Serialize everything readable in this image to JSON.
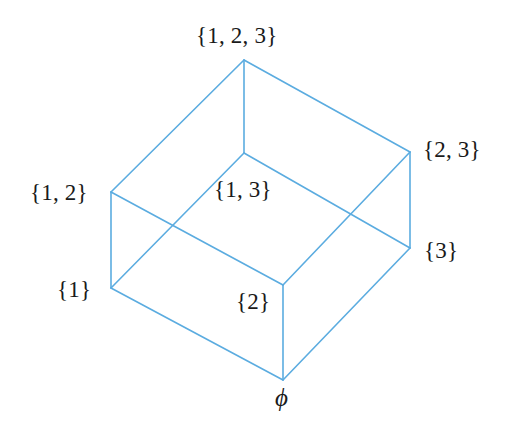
{
  "figure": {
    "width": 511,
    "height": 436,
    "background": "#ffffff",
    "edge_color": "#5BACE0",
    "edge_width": 1.6,
    "label_color": "#1a1a1a"
  },
  "chart_data": {
    "type": "diagram",
    "title": "",
    "nodes": [
      {
        "id": "full",
        "label": "{1, 2, 3}",
        "x": 244,
        "y": 60,
        "label_x": 196,
        "label_y": 24,
        "label_anchor": "above"
      },
      {
        "id": "s12",
        "label": "{1, 2}",
        "x": 111,
        "y": 192,
        "label_x": 30,
        "label_y": 181,
        "label_anchor": "left"
      },
      {
        "id": "s13",
        "label": "{1, 3}",
        "x": 244,
        "y": 153,
        "label_x": 214,
        "label_y": 178,
        "label_anchor": "below"
      },
      {
        "id": "s23",
        "label": "{2, 3}",
        "x": 410,
        "y": 152,
        "label_x": 423,
        "label_y": 138,
        "label_anchor": "right"
      },
      {
        "id": "s1",
        "label": "{1}",
        "x": 111,
        "y": 288,
        "label_x": 57,
        "label_y": 278,
        "label_anchor": "left"
      },
      {
        "id": "s2",
        "label": "{2}",
        "x": 283,
        "y": 285,
        "label_x": 236,
        "label_y": 290,
        "label_anchor": "below-left"
      },
      {
        "id": "s3",
        "label": "{3}",
        "x": 410,
        "y": 248,
        "label_x": 424,
        "label_y": 239,
        "label_anchor": "right"
      },
      {
        "id": "empty",
        "label": "ϕ",
        "x": 283,
        "y": 380,
        "label_x": 275,
        "label_y": 385,
        "label_anchor": "below"
      }
    ],
    "edges": [
      {
        "from": "full",
        "to": "s12"
      },
      {
        "from": "full",
        "to": "s13"
      },
      {
        "from": "full",
        "to": "s23"
      },
      {
        "from": "s12",
        "to": "s1"
      },
      {
        "from": "s12",
        "to": "s2"
      },
      {
        "from": "s13",
        "to": "s1"
      },
      {
        "from": "s13",
        "to": "s3"
      },
      {
        "from": "s23",
        "to": "s2"
      },
      {
        "from": "s23",
        "to": "s3"
      },
      {
        "from": "s1",
        "to": "empty"
      },
      {
        "from": "s2",
        "to": "empty"
      },
      {
        "from": "s3",
        "to": "empty"
      }
    ]
  }
}
